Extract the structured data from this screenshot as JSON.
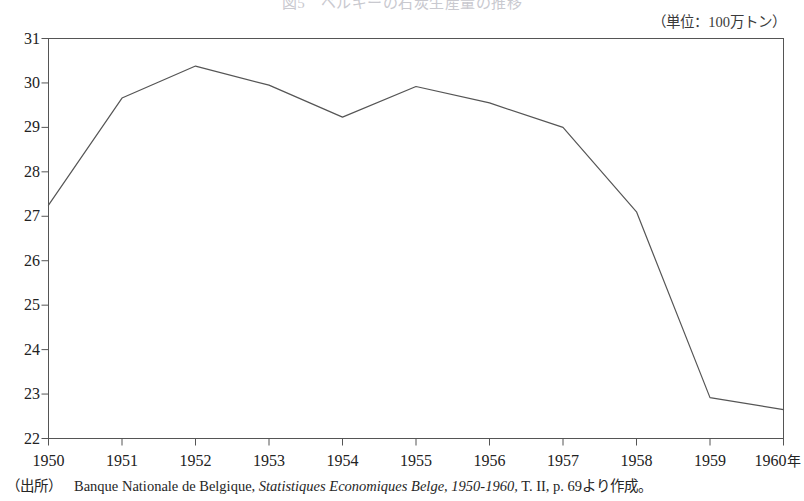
{
  "figure": {
    "title_faded": "図5　ベルギーの石炭生産量の推移",
    "unit_label": "（単位：100万トン）",
    "source_tag": "（出所）",
    "source_body_1": "Banque Nationale de Belgique,",
    "source_italic": "Statistiques Economiques Belge, 1950-1960,",
    "source_body_2": "T. II, p. 69より作成。",
    "year_suffix": "年",
    "line_color": "#555555",
    "axis_color": "#555555"
  },
  "chart_data": {
    "type": "line",
    "title": "図5　ベルギーの石炭生産量の推移",
    "xlabel": "年",
    "ylabel": "",
    "unit": "100万トン",
    "x": [
      1950,
      1951,
      1952,
      1953,
      1954,
      1955,
      1956,
      1957,
      1958,
      1959,
      1960
    ],
    "categories": [
      "1950",
      "1951",
      "1952",
      "1953",
      "1954",
      "1955",
      "1956",
      "1957",
      "1958",
      "1959",
      "1960"
    ],
    "values": [
      27.25,
      29.66,
      30.38,
      29.95,
      29.23,
      29.92,
      29.55,
      29.0,
      27.1,
      22.92,
      22.65
    ],
    "series": [
      {
        "name": "石炭生産量",
        "values": [
          27.25,
          29.66,
          30.38,
          29.95,
          29.23,
          29.92,
          29.55,
          29.0,
          27.1,
          22.92,
          22.65
        ]
      }
    ],
    "ylim": [
      22,
      31
    ],
    "xlim": [
      1950,
      1960
    ],
    "yticks": [
      22,
      23,
      24,
      25,
      26,
      27,
      28,
      29,
      30,
      31
    ],
    "ytick_labels": [
      "22",
      "23",
      "24",
      "25",
      "26",
      "27",
      "28",
      "29",
      "30",
      "31"
    ],
    "xticks": [
      1950,
      1951,
      1952,
      1953,
      1954,
      1955,
      1956,
      1957,
      1958,
      1959,
      1960
    ],
    "xtick_labels": [
      "1950",
      "1951",
      "1952",
      "1953",
      "1954",
      "1955",
      "1956",
      "1957",
      "1958",
      "1959",
      "1960"
    ],
    "grid": false,
    "legend": "none",
    "marker": "none"
  }
}
